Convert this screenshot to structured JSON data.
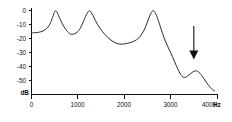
{
  "figure": {
    "kind": "spectral-envelope-plot",
    "background_color": "#ffffff",
    "curve_color": "#2a2a2a",
    "axis_color": "#111111"
  },
  "axes": {
    "y_unit_label": "dB",
    "x_unit_label": "Hz",
    "y_tick_labels": [
      "0",
      "-10",
      "-20",
      "-30",
      "-40",
      "-50"
    ],
    "x_tick_labels": [
      "0",
      "1000",
      "2000",
      "3000",
      "4000"
    ]
  },
  "annotation": {
    "arrow_name": "down-arrow",
    "arrow_points_at_hz": 3500,
    "arrow_color": "#111111"
  },
  "chart_data": {
    "type": "line",
    "title": "",
    "subtitle": "",
    "xlabel": "Hz",
    "ylabel": "dB",
    "xlim": [
      0,
      4000
    ],
    "ylim": [
      -57,
      2
    ],
    "grid": false,
    "legend": false,
    "legend_position": "none",
    "xticks": [
      0,
      1000,
      2000,
      3000,
      4000
    ],
    "xticklabels": [
      "0",
      "1000",
      "2000",
      "3000",
      "4000"
    ],
    "yticks": [
      0,
      -10,
      -20,
      -30,
      -40,
      -50
    ],
    "yticklabels": [
      "0",
      "-10",
      "-20",
      "-30",
      "-40",
      "-50"
    ],
    "series": [
      {
        "name": "spectral envelope",
        "x": [
          0,
          100,
          200,
          300,
          380,
          440,
          490,
          520,
          560,
          620,
          700,
          790,
          860,
          940,
          1030,
          1110,
          1180,
          1235,
          1280,
          1340,
          1420,
          1530,
          1650,
          1780,
          1900,
          2010,
          2120,
          2230,
          2340,
          2440,
          2530,
          2600,
          2650,
          2710,
          2780,
          2860,
          2950,
          3040,
          3120,
          3200,
          3270,
          3340,
          3420,
          3500,
          3560,
          3630,
          3720,
          3820,
          3900,
          3950
        ],
        "y": [
          -16.0,
          -15.8,
          -15.2,
          -13.6,
          -10.8,
          -6.2,
          -1.6,
          -0.2,
          -1.8,
          -6.4,
          -11.6,
          -15.6,
          -17.0,
          -16.4,
          -13.8,
          -8.6,
          -3.2,
          -0.4,
          -1.0,
          -4.6,
          -9.8,
          -15.0,
          -19.4,
          -22.6,
          -24.0,
          -23.8,
          -23.0,
          -21.6,
          -18.6,
          -13.2,
          -5.4,
          -0.6,
          -0.8,
          -4.8,
          -11.8,
          -19.6,
          -26.6,
          -33.0,
          -39.2,
          -44.8,
          -47.6,
          -47.4,
          -45.4,
          -43.4,
          -43.2,
          -44.8,
          -48.8,
          -53.6,
          -56.4,
          -57.4
        ]
      }
    ],
    "annotations": [
      {
        "type": "arrow",
        "label": "",
        "x": 3500,
        "y_from": -11,
        "y_to": -35,
        "direction": "down"
      }
    ],
    "features": {
      "peaks": [
        {
          "hz": 520,
          "db": 0
        },
        {
          "hz": 1235,
          "db": 0
        },
        {
          "hz": 2600,
          "db": 0
        },
        {
          "hz": 3500,
          "db": -43
        }
      ],
      "valleys": [
        {
          "hz": 860,
          "db": -17
        },
        {
          "hz": 1900,
          "db": -24
        },
        {
          "hz": 3250,
          "db": -48
        }
      ]
    }
  }
}
